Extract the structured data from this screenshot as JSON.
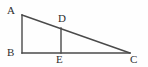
{
  "figure": {
    "kind": "geometry-diagram",
    "background_color": "#fefefe",
    "stroke_color": "#4a4a4a",
    "stroke_width": 1.4,
    "label_color": "#2e2e2e",
    "canvas": {
      "width": 148,
      "height": 67
    },
    "points": [
      {
        "id": "A",
        "label": "A",
        "x": 22,
        "y": 15,
        "label_x": 7,
        "label_y": 5
      },
      {
        "id": "B",
        "label": "B",
        "x": 22,
        "y": 53,
        "label_x": 7,
        "label_y": 47
      },
      {
        "id": "C",
        "label": "C",
        "x": 130,
        "y": 53,
        "label_x": 130,
        "label_y": 54
      },
      {
        "id": "D",
        "label": "D",
        "x": 61,
        "y": 28,
        "label_x": 58,
        "label_y": 13
      },
      {
        "id": "E",
        "label": "E",
        "x": 61,
        "y": 53,
        "label_x": 56,
        "label_y": 54
      }
    ],
    "segments": [
      {
        "id": "AB",
        "from": "A",
        "to": "B",
        "name": "segment-ab"
      },
      {
        "id": "BC",
        "from": "B",
        "to": "C",
        "name": "segment-bc"
      },
      {
        "id": "AC",
        "from": "A",
        "to": "C",
        "name": "segment-ac-hypotenuse"
      },
      {
        "id": "DE",
        "from": "D",
        "to": "E",
        "name": "segment-de"
      }
    ]
  }
}
